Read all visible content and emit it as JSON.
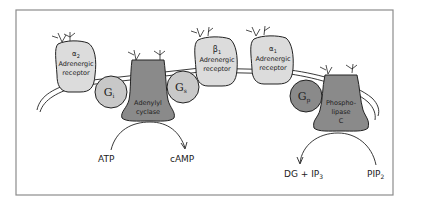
{
  "figure": {
    "type": "signal-transduction-diagram"
  },
  "receptors": [
    {
      "id": "alpha2",
      "greek": "α",
      "subscript": "2",
      "line1": "Adrenergic",
      "line2": "receptor"
    },
    {
      "id": "beta1",
      "greek": "β",
      "subscript": "1",
      "line1": "Adrenergic",
      "line2": "receptor"
    },
    {
      "id": "alpha1",
      "greek": "α",
      "subscript": "1",
      "line1": "Adrenergic",
      "line2": "receptor"
    }
  ],
  "g_proteins": [
    {
      "id": "gi",
      "main": "G",
      "subscript": "i"
    },
    {
      "id": "gs",
      "main": "G",
      "subscript": "s"
    },
    {
      "id": "gp",
      "main": "G",
      "subscript": "p"
    }
  ],
  "effectors": [
    {
      "id": "adenylyl-cyclase",
      "lines": [
        "Adenylyl",
        "cyclase"
      ]
    },
    {
      "id": "phospholipase-c",
      "lines": [
        "Phospho-",
        "lipase",
        "C"
      ]
    }
  ],
  "reactions": [
    {
      "id": "camp",
      "substrate": "ATP",
      "product": "cAMP"
    },
    {
      "id": "ip3",
      "substrate": "PIP",
      "substrate_subscript": "2",
      "product_prefix": "DG + IP",
      "product_subscript": "3"
    }
  ],
  "colors": {
    "receptor_fill": "#dcdcdc",
    "gprotein_fill": "#c8c8c8",
    "effector_fill": "#8a8a8a",
    "outline": "#222222",
    "frame": "#8c8c8c"
  }
}
